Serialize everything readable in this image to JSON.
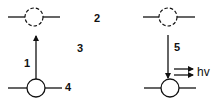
{
  "diagram": {
    "type": "energy-level transition diagram",
    "colors": {
      "ink": "#111111",
      "background": "#ffffff"
    },
    "levels": [
      {
        "id": "excited-left",
        "style": "dashed"
      },
      {
        "id": "excited-right",
        "style": "dashed"
      },
      {
        "id": "ground-left",
        "style": "solid"
      },
      {
        "id": "ground-right",
        "style": "solid"
      }
    ],
    "labels": {
      "l1": "1",
      "l2": "2",
      "l3": "3",
      "l4": "4",
      "l5": "5",
      "emission": "hv"
    },
    "transitions": [
      {
        "label": "1",
        "from": "ground-left",
        "to": "excited-left",
        "direction": "up"
      },
      {
        "label": "5",
        "from": "excited-right",
        "to": "ground-right",
        "direction": "down",
        "emits": "hv"
      }
    ]
  }
}
